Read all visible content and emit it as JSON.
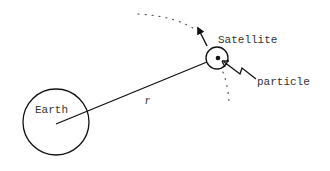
{
  "diagram": {
    "labels": {
      "earth": "Earth",
      "satellite": "Satellite",
      "particle": "particle",
      "radius": "r"
    },
    "colors": {
      "stroke": "#111111",
      "text": "#333333",
      "background": "#ffffff"
    },
    "elements": {
      "earth_circle": {
        "cx": 56,
        "cy": 122,
        "r": 33
      },
      "satellite_circle": {
        "cx": 217,
        "cy": 58,
        "r": 11
      },
      "radius_line": {
        "x1": 56,
        "y1": 124,
        "x2": 207,
        "y2": 62
      },
      "velocity_arrow": {
        "from": [
          207,
          46
        ],
        "to": [
          197,
          27
        ]
      },
      "orbit_path": "dotted"
    }
  }
}
